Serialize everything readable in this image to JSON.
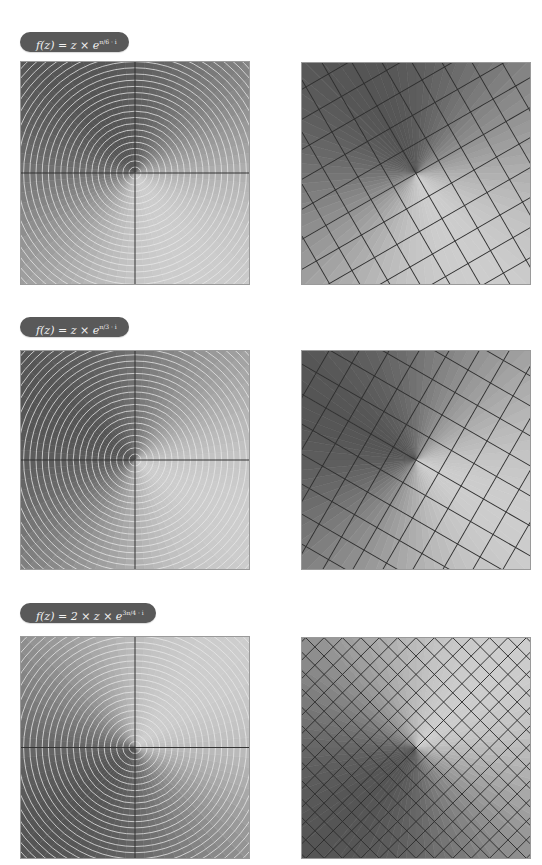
{
  "panels": [
    {
      "label": {
        "prefix": "f(z) = z × e",
        "exponent": "π/6 · i"
      },
      "rotation_deg": 30,
      "scale": 1,
      "domain_plot": {
        "name": "domain-polar-plot",
        "shade_angle_deg": 30
      },
      "image_plot": {
        "name": "image-grid-plot",
        "grid_angle_deg": 30,
        "grid_spacing": 26
      }
    },
    {
      "label": {
        "prefix": "f(z) = z × e",
        "exponent": "π/3 · i"
      },
      "rotation_deg": 60,
      "scale": 1,
      "domain_plot": {
        "name": "domain-polar-plot",
        "shade_angle_deg": 60
      },
      "image_plot": {
        "name": "image-grid-plot",
        "grid_angle_deg": 60,
        "grid_spacing": 26
      }
    },
    {
      "label": {
        "prefix": "f(z) =  2 × z × e",
        "exponent": "3π/4 · i"
      },
      "rotation_deg": 135,
      "scale": 2,
      "domain_plot": {
        "name": "domain-polar-plot",
        "shade_angle_deg": 135
      },
      "image_plot": {
        "name": "image-grid-plot",
        "grid_angle_deg": 45,
        "grid_spacing": 13
      }
    }
  ],
  "colors": {
    "label_bg": "#595959",
    "label_text": "#f2f2f2",
    "circle_line": "#e8e8e8",
    "axis_line": "#333333",
    "grid_line": "#2e2e2e"
  }
}
